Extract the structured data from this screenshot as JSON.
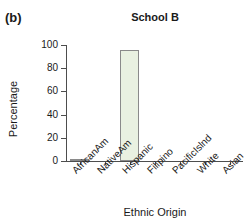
{
  "figure": {
    "panel_label": "(b)"
  },
  "chart_data": {
    "type": "bar",
    "title": "School B",
    "xlabel": "Ethnic Origin",
    "ylabel": "Percentage",
    "categories": [
      "AfricanAm",
      "NativeAm",
      "Hispanic",
      "Filipino",
      "PacificIslnd",
      "White",
      "Asian"
    ],
    "values": [
      1,
      0,
      96,
      0,
      0,
      0,
      0
    ],
    "ylim": [
      0,
      100
    ],
    "yticks": [
      0,
      20,
      40,
      60,
      80,
      100
    ],
    "ytick_labels": [
      "0",
      "20",
      "40",
      "60",
      "80",
      "100"
    ],
    "grid": false,
    "legend": false,
    "bar_fill_color": "#e9f1e1",
    "bar_edge_color": "#8a8a8a",
    "axis_color": "#4d4d4d",
    "xtick_label_rotation": -45
  }
}
